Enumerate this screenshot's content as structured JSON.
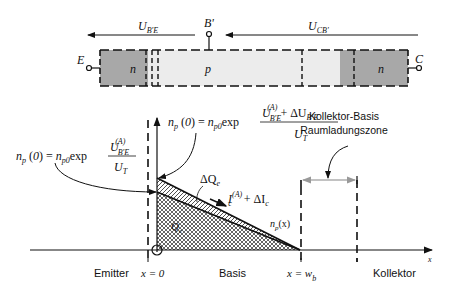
{
  "colors": {
    "n_region": "#a8a8a8",
    "p_region": "#ececec",
    "line": "#111111",
    "gray_arrow": "#999999"
  },
  "band": {
    "emitter_terminal": "E",
    "base_terminal": "B'",
    "collector_terminal": "C",
    "emitter_region": "n",
    "base_region": "p",
    "collector_region": "n",
    "voltage_be": {
      "main": "U",
      "sub": "B'E"
    },
    "voltage_cb": {
      "main": "U",
      "sub": "CB'"
    }
  },
  "equations": {
    "np0_left": {
      "lhs": "n",
      "lhs_sub": "p",
      "lhs_arg": "(0) = ",
      "factor": "n",
      "factor_sub": "p0",
      "func": "exp",
      "num_main": "U",
      "num_sup": "(A)",
      "num_sub": "B'E",
      "den_main": "U",
      "den_sub": "T"
    },
    "np0_right": {
      "lhs": "n",
      "lhs_sub": "p",
      "lhs_arg": "(0) = ",
      "factor": "n",
      "factor_sub": "p0",
      "func": "exp",
      "num_main": "U",
      "num_sup": "(A)",
      "num_sub": "B'E",
      "num_plus": " + ΔU",
      "num_plus_sub": "B'E",
      "den_main": "U",
      "den_sub": "T"
    }
  },
  "labels": {
    "delta_qe": {
      "main": "ΔQ",
      "sub": "e"
    },
    "qe": {
      "main": "Q",
      "sub": "e"
    },
    "ic": {
      "main": "I",
      "sup": "(A)",
      "sub": "c",
      "plus": " + ΔI",
      "plus_sub": "c"
    },
    "npx": {
      "main": "n",
      "sub": "p",
      "arg": "(x)"
    },
    "collector_base_line1": "Kollektor-Basis",
    "collector_base_line2": "Raumladungszone"
  },
  "axis": {
    "x_label": "x",
    "emitter": "Emitter",
    "x0": "x = 0",
    "basis": "Basis",
    "xwb": {
      "main": "x = w",
      "sub": "b"
    },
    "kollektor": "Kollektor"
  }
}
